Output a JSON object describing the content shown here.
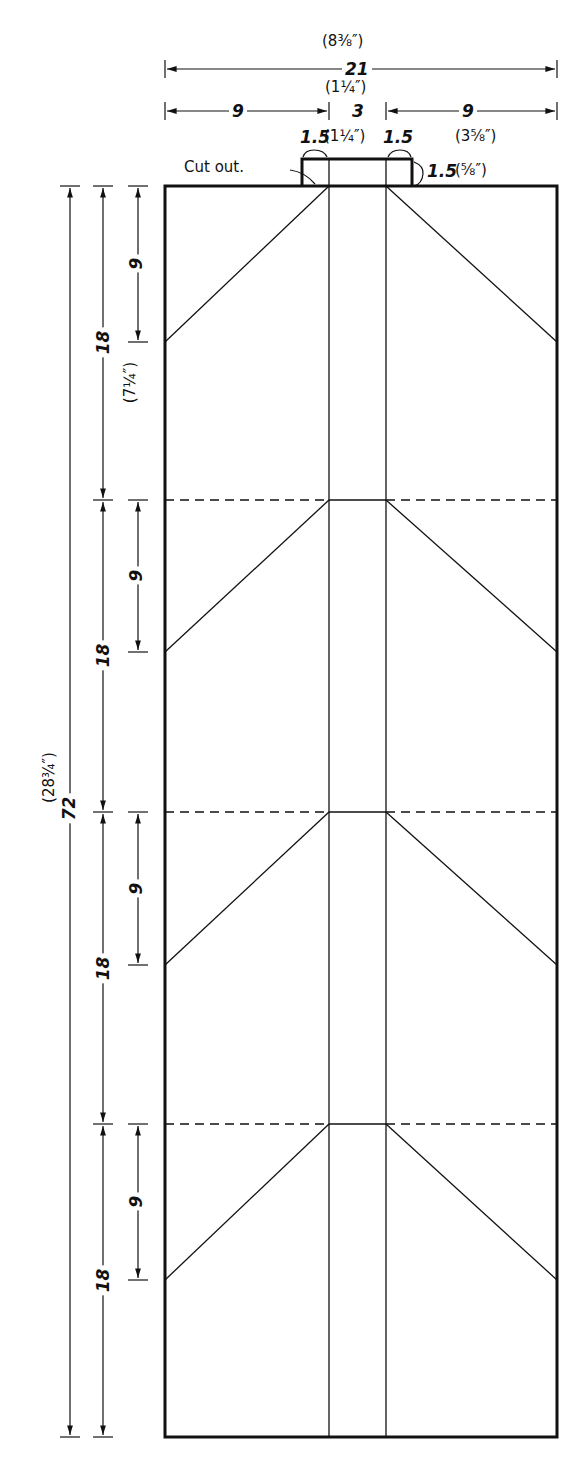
{
  "diagram": {
    "type": "folding pattern / cutting diagram",
    "units_note": "cm with inch equivalents in parentheses",
    "colors": {
      "line": "#111111",
      "background": "#ffffff"
    },
    "top_dims": {
      "total_width": "21",
      "total_width_in": "(8⅜″)",
      "left_panel": "9",
      "center": "3",
      "center_in": "(1¼″)",
      "right_panel": "9",
      "right_panel_in": "(3⅝″)",
      "tab_left": "1.5",
      "tab_center_in": "(1¼″)",
      "tab_right": "1.5",
      "tab_height": "1.5",
      "tab_height_in": "(⅝″)",
      "cutout_label": "Cut out."
    },
    "left_dims": {
      "total_height": "72",
      "total_height_in": "(28¾″)",
      "section": "18",
      "section_in": "(7¼″)",
      "sub_section": "9",
      "sections": [
        {
          "label": "18",
          "sub": "9"
        },
        {
          "label": "18",
          "sub": "9"
        },
        {
          "label": "18",
          "sub": "9"
        },
        {
          "label": "18",
          "sub": "9"
        }
      ]
    }
  }
}
